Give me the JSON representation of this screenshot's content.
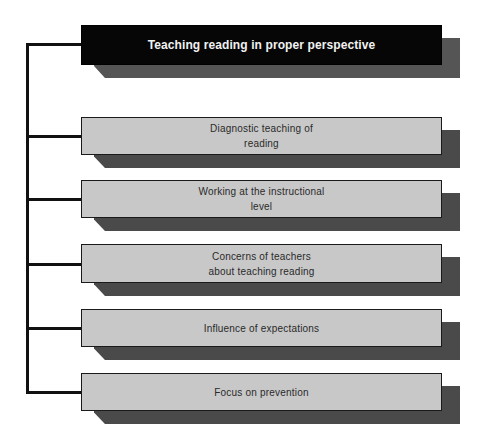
{
  "diagram": {
    "type": "hierarchy-tree",
    "root": {
      "label": "Teaching reading in proper perspective",
      "fill": "#060606",
      "text_color": "#f2f2f2"
    },
    "children": [
      {
        "label": "Diagnostic teaching of\nreading"
      },
      {
        "label": "Working at the instructional\nlevel"
      },
      {
        "label": "Concerns of teachers\nabout teaching reading"
      },
      {
        "label": "Influence of expectations"
      },
      {
        "label": "Focus on prevention"
      }
    ],
    "colors": {
      "child_fill": "#c8c8c8",
      "shadow": "#4a4a4a",
      "connector": "#111111",
      "child_text": "#2a2a2a"
    }
  }
}
